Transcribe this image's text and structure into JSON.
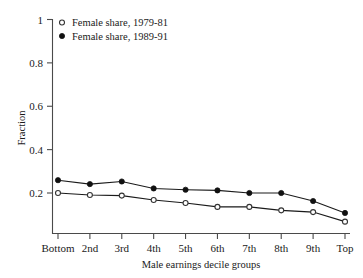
{
  "chart_data": {
    "type": "line",
    "title": "",
    "xlabel": "Male earnings decile groups",
    "ylabel": "Fraction",
    "categories": [
      "Bottom",
      "2nd",
      "3rd",
      "4th",
      "5th",
      "6th",
      "7th",
      "8th",
      "9th",
      "Top"
    ],
    "ylim": [
      0,
      1
    ],
    "yticks": [
      "0.2",
      "0.4",
      "0.6",
      "0.8",
      "1"
    ],
    "ytick_values": [
      0.2,
      0.4,
      0.6,
      0.8,
      1.0
    ],
    "grid": false,
    "legend_position": "top-left",
    "series": [
      {
        "name": "Female share, 1979-81",
        "marker": "open-circle",
        "values": [
          0.2,
          0.191,
          0.188,
          0.168,
          0.154,
          0.136,
          0.136,
          0.12,
          0.112,
          0.068
        ]
      },
      {
        "name": "Female share, 1989-91",
        "marker": "filled-circle",
        "values": [
          0.259,
          0.241,
          0.253,
          0.221,
          0.215,
          0.212,
          0.2,
          0.2,
          0.163,
          0.108
        ]
      }
    ]
  },
  "colors": {
    "axis": "#4a4a4a",
    "line": "#1a1a1a",
    "filled_marker": "#111111",
    "open_marker_fill": "#ffffff",
    "background": "#ffffff"
  },
  "legend": {
    "entries": [
      {
        "label": "Female share, 1979-81",
        "marker": "open-circle"
      },
      {
        "label": "Female share, 1989-91",
        "marker": "filled-circle"
      }
    ]
  }
}
